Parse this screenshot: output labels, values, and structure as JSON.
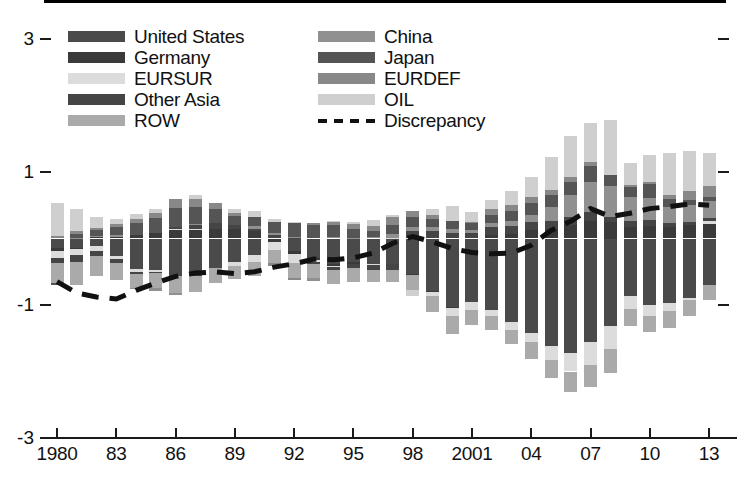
{
  "chart_data": {
    "type": "bar",
    "subtype": "stacked-bar-with-line",
    "title": "",
    "xlabel": "",
    "ylabel": "",
    "ylim": [
      -3,
      3
    ],
    "ytick_values": [
      3,
      1,
      -1,
      -3
    ],
    "ytick_labels": [
      "3",
      "1",
      "-1",
      "-3"
    ],
    "grid": false,
    "legend_position": "top",
    "x": [
      1980,
      1981,
      1982,
      1983,
      1984,
      1985,
      1986,
      1987,
      1988,
      1989,
      1990,
      1991,
      1992,
      1993,
      1994,
      1995,
      1996,
      1997,
      1998,
      1999,
      2000,
      2001,
      2002,
      2003,
      2004,
      2005,
      2006,
      2007,
      2008,
      2009,
      2010,
      2011,
      2012,
      2013
    ],
    "xtick_values": [
      1980,
      1983,
      1986,
      1989,
      1992,
      1995,
      1998,
      2001,
      2004,
      2007,
      2010,
      2013
    ],
    "xtick_labels": [
      "1980",
      "83",
      "86",
      "89",
      "92",
      "95",
      "98",
      "2001",
      "04",
      "07",
      "10",
      "13"
    ],
    "series": [
      {
        "name": "United States",
        "color": "#4a4a4a",
        "values": [
          -0.14,
          -0.14,
          -0.12,
          -0.27,
          -0.46,
          -0.47,
          -0.57,
          -0.57,
          -0.44,
          -0.35,
          -0.25,
          0.02,
          -0.19,
          -0.29,
          -0.38,
          -0.35,
          -0.38,
          -0.38,
          -0.54,
          -0.79,
          -1.03,
          -0.96,
          -1.08,
          -1.26,
          -1.42,
          -1.61,
          -1.72,
          -1.56,
          -1.32,
          -0.86,
          -1.0,
          -0.97,
          -0.9,
          -0.7
        ]
      },
      {
        "name": "Germany",
        "color": "#3a3a3a",
        "values": [
          -0.05,
          -0.02,
          0.02,
          0.03,
          0.05,
          0.08,
          0.13,
          0.13,
          0.14,
          0.14,
          0.12,
          -0.05,
          -0.04,
          -0.03,
          -0.03,
          -0.03,
          -0.01,
          -0.01,
          -0.01,
          -0.01,
          -0.02,
          0.0,
          0.06,
          0.07,
          0.13,
          0.15,
          0.2,
          0.27,
          0.25,
          0.17,
          0.19,
          0.18,
          0.2,
          0.22
        ]
      },
      {
        "name": "EURSUR",
        "color": "#dcdcdc",
        "values": [
          -0.1,
          -0.09,
          -0.07,
          -0.04,
          -0.04,
          -0.03,
          0.02,
          0.01,
          -0.01,
          -0.06,
          -0.1,
          -0.12,
          -0.14,
          -0.04,
          -0.02,
          -0.01,
          -0.01,
          0.01,
          0.0,
          -0.07,
          -0.12,
          -0.11,
          -0.09,
          -0.11,
          -0.14,
          -0.21,
          -0.28,
          -0.34,
          -0.34,
          -0.2,
          -0.16,
          -0.12,
          -0.02,
          0.04
        ]
      },
      {
        "name": "Other Asia",
        "color": "#454545",
        "values": [
          -0.08,
          -0.1,
          -0.07,
          -0.06,
          -0.03,
          -0.02,
          0.02,
          0.07,
          0.09,
          0.06,
          0.03,
          0.03,
          0.01,
          -0.02,
          -0.04,
          -0.06,
          -0.08,
          -0.09,
          0.12,
          0.12,
          0.09,
          0.08,
          0.11,
          0.12,
          0.12,
          0.11,
          0.12,
          0.13,
          0.08,
          0.1,
          0.09,
          0.06,
          0.05,
          0.05
        ]
      },
      {
        "name": "ROW",
        "color": "#aaaaaa",
        "values": [
          -0.3,
          -0.35,
          -0.3,
          -0.25,
          -0.21,
          -0.22,
          -0.25,
          -0.24,
          -0.22,
          -0.2,
          -0.21,
          -0.2,
          -0.22,
          -0.22,
          -0.21,
          -0.2,
          -0.18,
          -0.18,
          -0.22,
          -0.24,
          -0.26,
          -0.23,
          -0.21,
          -0.22,
          -0.25,
          -0.28,
          -0.31,
          -0.33,
          -0.36,
          -0.25,
          -0.25,
          -0.26,
          -0.24,
          -0.22
        ]
      },
      {
        "name": "China",
        "color": "#909090",
        "values": [
          0.0,
          0.01,
          0.02,
          0.02,
          -0.01,
          -0.05,
          -0.03,
          0.01,
          0.0,
          0.0,
          0.04,
          0.04,
          0.02,
          -0.04,
          0.02,
          0.01,
          0.02,
          0.06,
          0.06,
          0.05,
          0.05,
          0.05,
          0.06,
          0.07,
          0.11,
          0.21,
          0.33,
          0.45,
          0.46,
          0.36,
          0.33,
          0.23,
          0.25,
          0.25
        ]
      },
      {
        "name": "Japan",
        "color": "#555555",
        "values": [
          -0.03,
          0.06,
          0.09,
          0.13,
          0.19,
          0.23,
          0.29,
          0.26,
          0.22,
          0.14,
          0.13,
          0.16,
          0.2,
          0.21,
          0.19,
          0.14,
          0.09,
          0.14,
          0.15,
          0.13,
          0.13,
          0.1,
          0.13,
          0.15,
          0.18,
          0.19,
          0.2,
          0.24,
          0.16,
          0.15,
          0.21,
          0.13,
          0.08,
          0.06
        ]
      },
      {
        "name": "EURDEF",
        "color": "#888888",
        "values": [
          0.04,
          0.04,
          0.03,
          0.04,
          0.06,
          0.07,
          0.14,
          0.12,
          0.09,
          0.05,
          0.0,
          -0.04,
          -0.03,
          0.03,
          0.05,
          0.07,
          0.08,
          0.11,
          0.09,
          0.05,
          0.0,
          0.02,
          0.08,
          0.09,
          0.09,
          0.07,
          0.07,
          0.06,
          0.0,
          0.02,
          0.03,
          0.06,
          0.13,
          0.17
        ]
      },
      {
        "name": "OIL",
        "color": "#cfcfcf",
        "values": [
          0.49,
          0.33,
          0.17,
          0.08,
          0.07,
          0.06,
          0.0,
          0.05,
          0.0,
          0.06,
          0.1,
          0.05,
          0.02,
          0.0,
          0.01,
          0.03,
          0.09,
          0.04,
          -0.09,
          0.09,
          0.22,
          0.15,
          0.14,
          0.21,
          0.3,
          0.5,
          0.62,
          0.58,
          0.83,
          0.33,
          0.4,
          0.63,
          0.6,
          0.5
        ]
      }
    ],
    "discrepancy": {
      "name": "Discrepancy",
      "color": "#111111",
      "style": "dashed",
      "values": [
        -0.65,
        -0.82,
        -0.88,
        -0.91,
        -0.78,
        -0.67,
        -0.57,
        -0.52,
        -0.5,
        -0.53,
        -0.5,
        -0.43,
        -0.38,
        -0.31,
        -0.32,
        -0.29,
        -0.22,
        -0.07,
        0.03,
        -0.05,
        -0.15,
        -0.21,
        -0.23,
        -0.22,
        -0.1,
        0.12,
        0.26,
        0.45,
        0.33,
        0.38,
        0.45,
        0.48,
        0.52,
        0.5
      ]
    }
  },
  "legend": {
    "left_column": [
      {
        "label": "United States",
        "color": "#4a4a4a",
        "type": "swatch"
      },
      {
        "label": "Germany",
        "color": "#3a3a3a",
        "type": "swatch"
      },
      {
        "label": "EURSUR",
        "color": "#dcdcdc",
        "type": "swatch"
      },
      {
        "label": "Other Asia",
        "color": "#454545",
        "type": "swatch"
      },
      {
        "label": "ROW",
        "color": "#aaaaaa",
        "type": "swatch"
      }
    ],
    "right_column": [
      {
        "label": "China",
        "color": "#909090",
        "type": "swatch"
      },
      {
        "label": "Japan",
        "color": "#555555",
        "type": "swatch"
      },
      {
        "label": "EURDEF",
        "color": "#888888",
        "type": "swatch"
      },
      {
        "label": "OIL",
        "color": "#cfcfcf",
        "type": "swatch"
      },
      {
        "label": "Discrepancy",
        "color": "#111111",
        "type": "dash"
      }
    ]
  },
  "axis": {
    "y_labels": [
      "3",
      "1",
      "-1",
      "-3"
    ],
    "x_labels": [
      "1980",
      "83",
      "86",
      "89",
      "92",
      "95",
      "98",
      "2001",
      "04",
      "07",
      "10",
      "13"
    ]
  }
}
